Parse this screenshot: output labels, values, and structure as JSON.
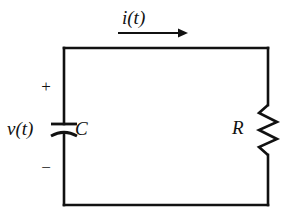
{
  "figure": {
    "kind": "circuit-schematic",
    "background_color": "#ffffff",
    "line_color": "#111111"
  },
  "labels": {
    "current": "i(t)",
    "voltage": "v(t)",
    "capacitor": "C",
    "resistor": "R",
    "polarity_plus": "+",
    "polarity_minus": "−"
  },
  "components": [
    {
      "name": "capacitor",
      "label": "C",
      "across_label": "v(t)",
      "branch": "left"
    },
    {
      "name": "resistor",
      "label": "R",
      "branch": "right"
    },
    {
      "name": "current-arrow",
      "label": "i(t)",
      "direction": "right",
      "branch": "top"
    }
  ],
  "geometry": {
    "loop": {
      "left": 64,
      "right": 268,
      "top": 48,
      "bottom": 205
    },
    "arrow": {
      "x1": 118,
      "x2": 186,
      "y": 33
    },
    "capacitor": {
      "x": 64,
      "plate_top_y": 124,
      "plate_bottom_y": 133,
      "plate_half_width": 13
    },
    "resistor": {
      "x": 268,
      "top_y": 105,
      "bottom_y": 155,
      "amplitude": 9,
      "zigzags": 3
    }
  }
}
